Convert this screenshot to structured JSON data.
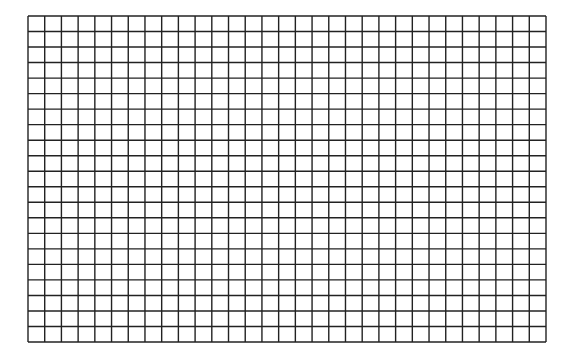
{
  "grid": {
    "columns": 31,
    "rows": 21,
    "left": 28,
    "top": 16,
    "right": 546,
    "bottom": 342,
    "line_color": "#222222",
    "line_width": 1.4,
    "background": "#ffffff"
  }
}
